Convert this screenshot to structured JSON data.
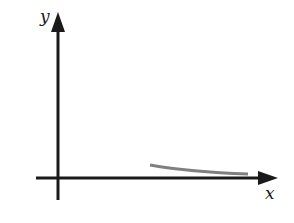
{
  "diagram": {
    "axes": {
      "x_label": "x",
      "y_label": "y",
      "color": "#1a1a1a"
    },
    "curve": {
      "color": "#808080",
      "description": "decreasing curve approaching x-axis asymptotically"
    }
  }
}
